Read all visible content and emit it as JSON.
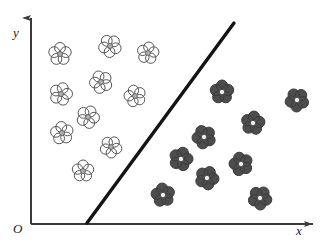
{
  "figure": {
    "name": "flower-classification-scatter",
    "width": 321,
    "height": 247,
    "background_color": "#ffffff"
  },
  "axes": {
    "x_label": "x",
    "y_label": "x",
    "origin_label": "O",
    "x_axis": {
      "y": 224,
      "x_start": 31,
      "x_end": 313,
      "arrow": "right"
    },
    "y_axis": {
      "x": 31,
      "y_start": 224,
      "y_end": 18,
      "arrow": "up"
    },
    "color": "#3a3a3a",
    "line_width": 2
  },
  "labels": {
    "y": "y",
    "x": "x",
    "origin": "O"
  },
  "boundary_line": {
    "x1": 87,
    "y1": 223,
    "x2": 234,
    "y2": 23,
    "color": "#141414",
    "width": 3.4
  },
  "chart_data": {
    "type": "scatter",
    "title": "",
    "xlabel": "x",
    "ylabel": "y",
    "grid": false,
    "legend": null,
    "annotations": [
      "O"
    ],
    "series": [
      {
        "name": "light-flowers",
        "marker": "flower-5-petal-outline",
        "fill": "#ffffff",
        "stroke": "#555555",
        "center_fill": "#b0b0b0",
        "count": 11,
        "points": [
          {
            "x": 60,
            "y": 54,
            "r": 11.5
          },
          {
            "x": 110,
            "y": 46,
            "r": 11.5
          },
          {
            "x": 148,
            "y": 53,
            "r": 11.0
          },
          {
            "x": 101,
            "y": 82,
            "r": 11.5
          },
          {
            "x": 61,
            "y": 94,
            "r": 11.5
          },
          {
            "x": 135,
            "y": 96,
            "r": 11.0
          },
          {
            "x": 88,
            "y": 117,
            "r": 11.5
          },
          {
            "x": 62,
            "y": 133,
            "r": 11.5
          },
          {
            "x": 111,
            "y": 147,
            "r": 11.0
          },
          {
            "x": 83,
            "y": 171,
            "r": 11.0
          },
          {
            "x": 176,
            "y": 120,
            "r": 0
          }
        ]
      },
      {
        "name": "dark-flowers",
        "marker": "flower-5-petal-filled",
        "fill": "#4d4d4d",
        "stroke": "#3a3a3a",
        "center_fill": "#f0f0f0",
        "count": 11,
        "points": [
          {
            "x": 222,
            "y": 92,
            "r": 12.0
          },
          {
            "x": 297,
            "y": 100,
            "r": 12.0
          },
          {
            "x": 253,
            "y": 123,
            "r": 12.0
          },
          {
            "x": 204,
            "y": 137,
            "r": 12.0
          },
          {
            "x": 181,
            "y": 159,
            "r": 12.0
          },
          {
            "x": 241,
            "y": 164,
            "r": 12.0
          },
          {
            "x": 207,
            "y": 178,
            "r": 12.0
          },
          {
            "x": 163,
            "y": 195,
            "r": 12.0
          },
          {
            "x": 260,
            "y": 198,
            "r": 12.0
          }
        ]
      }
    ]
  }
}
